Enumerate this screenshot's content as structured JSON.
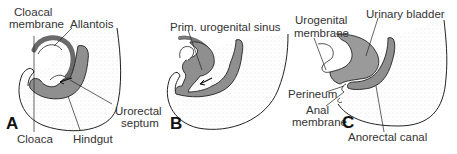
{
  "figure": {
    "panels": [
      {
        "letter": "A",
        "labels": {
          "cloacal_membrane_1": "Cloacal",
          "cloacal_membrane_2": "membrane",
          "allantois": "Allantois",
          "urorectal_septum_1": "Urorectal",
          "urorectal_septum_2": "septum",
          "cloaca": "Cloaca",
          "hindgut": "Hindgut"
        }
      },
      {
        "letter": "B",
        "labels": {
          "prim_urogenital_sinus": "Prim. urogenital sinus"
        }
      },
      {
        "letter": "C",
        "labels": {
          "urogenital_membrane_1": "Urogenital",
          "urogenital_membrane_2": "membrane",
          "urinary_bladder": "Urinary bladder",
          "perineum": "Perineum",
          "anal_membrane_1": "Anal",
          "anal_membrane_2": "membrane",
          "anorectal_canal": "Anorectal canal"
        }
      }
    ],
    "colors": {
      "endoderm_fill": "#8f8f8f",
      "outline": "#222222",
      "stipple": "#bbbbbb",
      "text": "#333333"
    }
  }
}
